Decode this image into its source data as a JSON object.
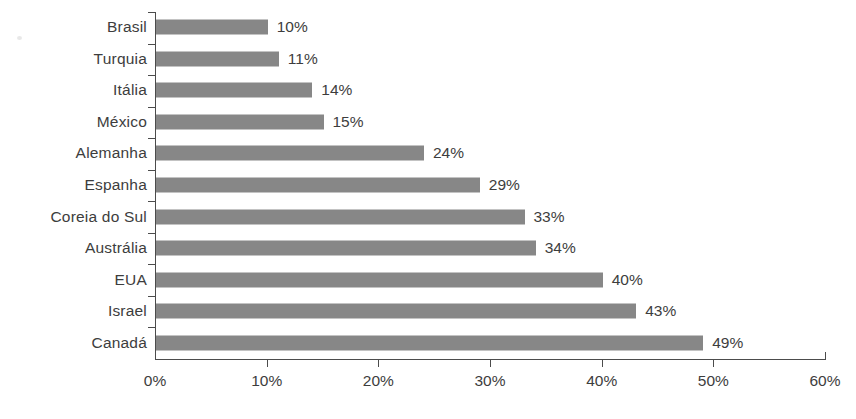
{
  "chart_data": {
    "type": "bar",
    "orientation": "horizontal",
    "title": "",
    "subtitle": "",
    "xlabel": "",
    "ylabel": "",
    "xlim": [
      0,
      60
    ],
    "grid": false,
    "legend": null,
    "value_suffix": "%",
    "xtick_labels": [
      "0%",
      "10%",
      "20%",
      "30%",
      "40%",
      "50%",
      "60%"
    ],
    "xticks": [
      0,
      10,
      20,
      30,
      40,
      50,
      60
    ],
    "categories": [
      "Brasil",
      "Turquia",
      "Itália",
      "México",
      "Alemanha",
      "Espanha",
      "Coreia do Sul",
      "Austrália",
      "EUA",
      "Israel",
      "Canadá"
    ],
    "values": [
      10,
      11,
      14,
      15,
      24,
      29,
      33,
      34,
      40,
      43,
      49
    ],
    "data_labels": [
      "10%",
      "11%",
      "14%",
      "15%",
      "24%",
      "29%",
      "33%",
      "34%",
      "40%",
      "43%",
      "49%"
    ],
    "colors": {
      "bar": "#878787",
      "axis": "#4c4c4c",
      "text": "#3d3d3d",
      "background": "#ffffff"
    }
  }
}
